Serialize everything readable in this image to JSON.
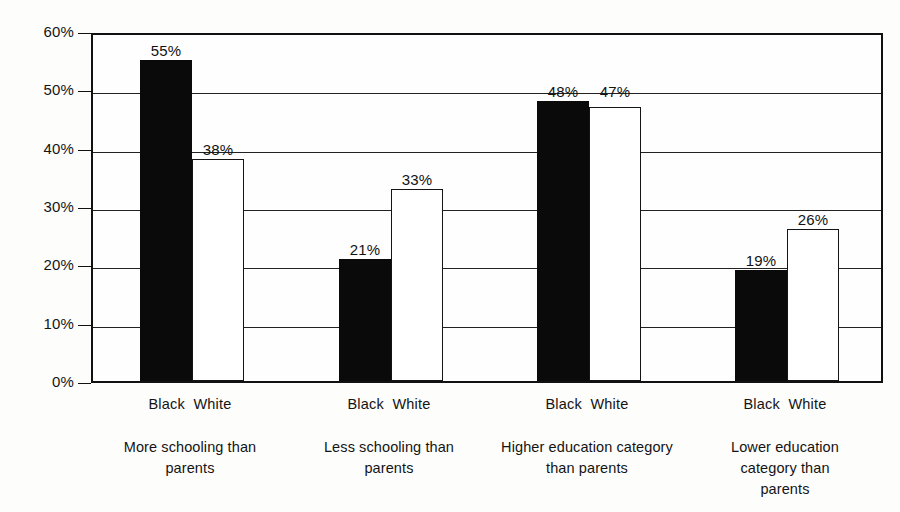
{
  "chart_data": {
    "type": "bar",
    "title": "",
    "subtitle": "",
    "xlabel": "",
    "ylabel": "",
    "ylim": [
      0,
      60
    ],
    "y_tick_labels": [
      "0%",
      "10%",
      "20%",
      "30%",
      "40%",
      "50%",
      "60%"
    ],
    "y_ticks": [
      0,
      10,
      20,
      30,
      40,
      50,
      60
    ],
    "grid": true,
    "legend_position": "none",
    "categories": [
      "More schooling than parents",
      "Less schooling than parents",
      "Higher education category than parents",
      "Lower education category than parents"
    ],
    "series": [
      {
        "name": "Black",
        "values": [
          55,
          21,
          48,
          19
        ],
        "color": "#0a0a0a"
      },
      {
        "name": "White",
        "values": [
          38,
          33,
          47,
          26
        ],
        "color": "#ffffff"
      }
    ],
    "data_labels": [
      [
        "55%",
        "38%"
      ],
      [
        "21%",
        "33%"
      ],
      [
        "48%",
        "47%"
      ],
      [
        "19%",
        "26%"
      ]
    ]
  },
  "axis": {
    "y_labels": [
      {
        "text": "60%",
        "value": 60
      },
      {
        "text": "50%",
        "value": 50
      },
      {
        "text": "40%",
        "value": 40
      },
      {
        "text": "30%",
        "value": 30
      },
      {
        "text": "20%",
        "value": 20
      },
      {
        "text": "10%",
        "value": 10
      },
      {
        "text": "0%",
        "value": 0
      }
    ]
  },
  "groups": [
    {
      "caption_line1": "More schooling than",
      "caption_line2": "parents",
      "caption_line3": "",
      "black_tick": "Black",
      "white_tick": "White",
      "black_label": "55%",
      "white_label": "38%"
    },
    {
      "caption_line1": "Less schooling than",
      "caption_line2": "parents",
      "caption_line3": "",
      "black_tick": "Black",
      "white_tick": "White",
      "black_label": "21%",
      "white_label": "33%"
    },
    {
      "caption_line1": "Higher education category",
      "caption_line2": "than parents",
      "caption_line3": "",
      "black_tick": "Black",
      "white_tick": "White",
      "black_label": "48%",
      "white_label": "47%"
    },
    {
      "caption_line1": "Lower education",
      "caption_line2": "category than",
      "caption_line3": "parents",
      "black_tick": "Black",
      "white_tick": "White",
      "black_label": "19%",
      "white_label": "26%"
    }
  ]
}
